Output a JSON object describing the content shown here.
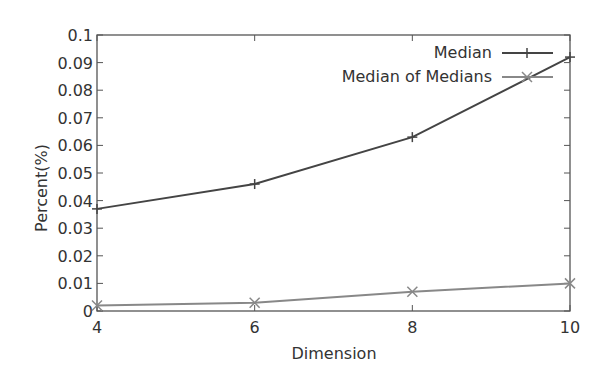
{
  "chart_data": {
    "type": "line",
    "title": "",
    "xlabel": "Dimension",
    "ylabel": "Percent(%)",
    "x": [
      4,
      6,
      8,
      10
    ],
    "xlim": [
      4,
      10
    ],
    "ylim": [
      0,
      0.1
    ],
    "x_ticks": [
      "4",
      "6",
      "8",
      "10"
    ],
    "y_ticks": [
      "0",
      "0.01",
      "0.02",
      "0.03",
      "0.04",
      "0.05",
      "0.06",
      "0.07",
      "0.08",
      "0.09",
      "0.1"
    ],
    "grid": false,
    "legend_position": "top-right inside",
    "series": [
      {
        "name": "Median",
        "marker": "plus",
        "color": "#444444",
        "values": [
          0.037,
          0.046,
          0.063,
          0.092
        ]
      },
      {
        "name": "Median of Medians",
        "marker": "cross",
        "color": "#888888",
        "values": [
          0.002,
          0.003,
          0.007,
          0.01
        ]
      }
    ]
  }
}
